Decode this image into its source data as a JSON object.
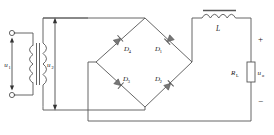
{
  "diagram": {
    "type": "electrical-schematic",
    "line_color": "#555555",
    "label_color": "#1a1a1a",
    "background": "#ffffff"
  },
  "labels": {
    "u1": "u",
    "u1_sub": "1",
    "u2": "u",
    "u2_sub": "2",
    "d1": "D",
    "d1_sub": "1",
    "d2": "D",
    "d2_sub": "2",
    "d3": "D",
    "d3_sub": "3",
    "d4": "D",
    "d4_sub": "4",
    "inductor": "L",
    "resistor": "R",
    "resistor_sub": "L",
    "uo": "u",
    "uo_sub": "o",
    "plus": "+",
    "minus": "−"
  },
  "components": {
    "transformer": {
      "name": "transformer",
      "primary_label": "u1",
      "secondary_label": "u2",
      "primary_terminals": 2
    },
    "bridge": {
      "name": "diode-bridge",
      "diodes": [
        "D1",
        "D2",
        "D3",
        "D4"
      ]
    },
    "filter_inductor": {
      "name": "inductor-L",
      "label": "L",
      "coil_bumps": 4,
      "has_core_bar": true
    },
    "load": {
      "name": "load-resistor",
      "label": "RL",
      "voltage_label": "uo",
      "polarity_top": "+",
      "polarity_bottom": "−"
    }
  }
}
